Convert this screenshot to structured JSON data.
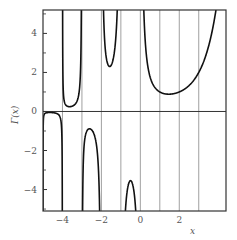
{
  "chart_data": {
    "type": "line",
    "title": "",
    "function": "gamma",
    "xlabel": "x",
    "ylabel": "Γ(x)",
    "xlim": [
      -5,
      4.4
    ],
    "ylim": [
      -5.1,
      5.2
    ],
    "x_ticks": [
      -4,
      -2,
      0,
      2
    ],
    "x_tick_labels": [
      "−4",
      "−2",
      "0",
      "2"
    ],
    "y_ticks": [
      4,
      2,
      0,
      -2,
      -4
    ],
    "y_tick_labels": [
      "4",
      "2",
      "0",
      "−2",
      "−4"
    ],
    "y_minor_ticks": [
      5,
      3,
      1,
      -1,
      -3,
      -5
    ],
    "vertical_gridlines": [
      -4,
      -3,
      -2,
      -1,
      0,
      1,
      2,
      3
    ],
    "zero_line": true,
    "legend": null,
    "series": [
      {
        "name": "Γ(x)",
        "segments": [
          {
            "domain": [
              -5,
              -4
            ],
            "shape": "inverted-U, max ≈ -0.2 near x≈-4.6"
          },
          {
            "domain": [
              -4,
              -3
            ],
            "shape": "U, min ≈ 0.2 near x≈-3.6"
          },
          {
            "domain": [
              -3,
              -2
            ],
            "shape": "inverted-U, max ≈ -0.9 near x≈-2.6"
          },
          {
            "domain": [
              -2,
              -1
            ],
            "shape": "U, min ≈ 2.3 near x≈-1.5"
          },
          {
            "domain": [
              -1,
              0
            ],
            "shape": "inverted-U, max ≈ -3.5 near x≈-0.5"
          },
          {
            "domain": [
              0,
              4.4
            ],
            "shape": "U, min ≈ 0.89 near x≈1.46"
          }
        ]
      }
    ],
    "colors": {
      "curve": "#111111",
      "grid": "#888888",
      "frame": "#333333",
      "text": "#555555"
    }
  }
}
